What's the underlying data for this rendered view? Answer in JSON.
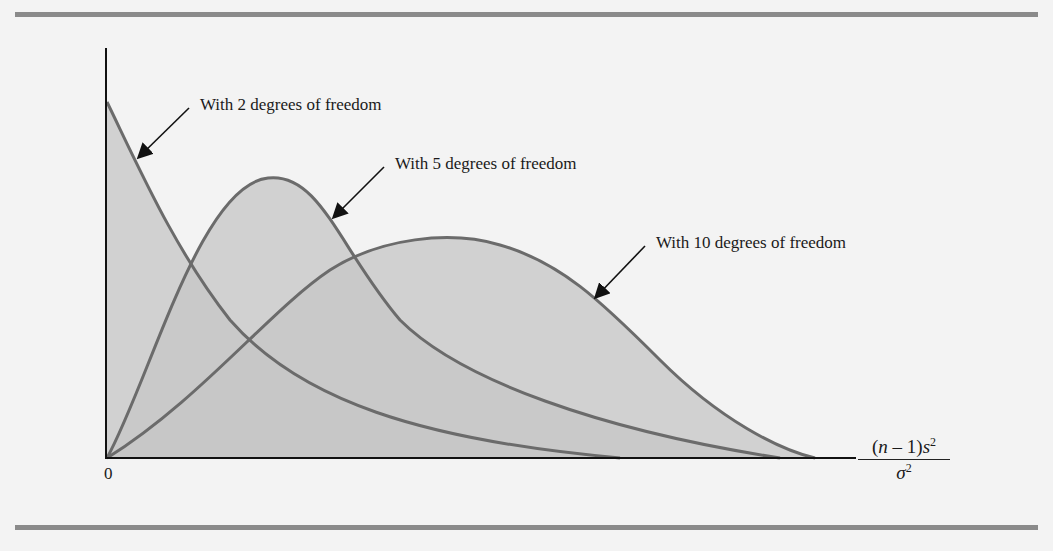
{
  "figure": {
    "type": "chi-square distribution curves",
    "annotations": [
      {
        "id": "df2",
        "label": "With 2 degrees of freedom"
      },
      {
        "id": "df5",
        "label": "With 5 degrees of freedom"
      },
      {
        "id": "df10",
        "label": "With 10 degrees of freedom"
      }
    ],
    "x_axis": {
      "origin_tick": "0",
      "label_numerator_prefix": "(",
      "label_n": "n",
      "label_mid": " – 1)",
      "label_s": "s",
      "label_exp": "2",
      "label_sigma": "σ",
      "label_sigma_exp": "2"
    },
    "colors": {
      "fill": "#c4c4c4",
      "curve": "#6b6b6b",
      "axis": "#111111",
      "rule": "#8a8a8a",
      "background": "#f3f3f3"
    }
  }
}
